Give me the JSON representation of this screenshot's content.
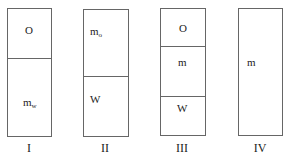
{
  "diagram": {
    "columns": [
      {
        "numeral": "I",
        "sections": [
          {
            "label": "O",
            "sub": ""
          },
          {
            "label": "m",
            "sub": "w"
          }
        ]
      },
      {
        "numeral": "II",
        "sections": [
          {
            "label": "m",
            "sub": "o"
          },
          {
            "label": "W",
            "sub": ""
          }
        ]
      },
      {
        "numeral": "III",
        "sections": [
          {
            "label": "O",
            "sub": ""
          },
          {
            "label": "m",
            "sub": ""
          },
          {
            "label": "W",
            "sub": ""
          }
        ]
      },
      {
        "numeral": "IV",
        "sections": [
          {
            "label": "m",
            "sub": ""
          }
        ]
      }
    ]
  }
}
